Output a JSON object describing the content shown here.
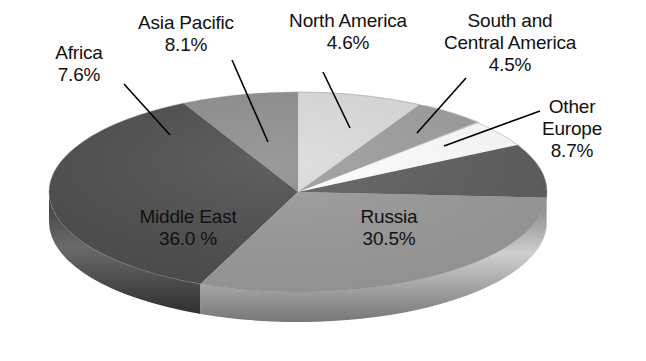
{
  "chart_data": {
    "type": "pie",
    "title": "",
    "subtitle": "",
    "xlabel": "",
    "ylabel": "",
    "legend_position": "none",
    "grid": false,
    "style": "3d-pie-grayscale",
    "value_unit": "%",
    "categories": [
      "Middle East",
      "Russia",
      "Other Europe",
      "Asia Pacific",
      "Africa",
      "North America",
      "South and Central America"
    ],
    "values": [
      36.0,
      30.5,
      8.7,
      8.1,
      7.6,
      4.6,
      4.5
    ],
    "slices": [
      {
        "name": "asia-pacific",
        "label_line1": "Asia Pacific",
        "label_line2": "8.1%",
        "value": 8.1,
        "color": "#dcdcdc",
        "side_color": "#bdbdbd",
        "label_placement": "outside-top-left",
        "has_leader_line": true
      },
      {
        "name": "north-america",
        "label_line1": "North America",
        "label_line2": "4.6%",
        "value": 4.6,
        "color": "#9e9e9e",
        "side_color": "#848484",
        "label_placement": "outside-top",
        "has_leader_line": true
      },
      {
        "name": "south-and-central-america",
        "label_line1": "South and",
        "label_line2": "Central America",
        "label_line3": "4.5%",
        "value": 4.5,
        "color": "#c9c9c9",
        "side_color": "#ababab",
        "label_placement": "outside-top-right",
        "has_leader_line": true
      },
      {
        "name": "other-europe",
        "label_line1": "Other",
        "label_line2": "Europe",
        "label_line3": "8.7%",
        "value": 8.7,
        "color": "#5e5e5e",
        "side_color": "#4a4a4a",
        "label_placement": "outside-right",
        "has_leader_line": true
      },
      {
        "name": "russia",
        "label_line1": "Russia",
        "label_line2": "30.5%",
        "value": 30.5,
        "color": "#9a9a9a",
        "side_color": "#8a8a8a",
        "label_placement": "inside",
        "has_leader_line": false
      },
      {
        "name": "middle-east",
        "label_line1": "Middle East",
        "label_line2": "36.0 %",
        "value": 36.0,
        "color": "#4e4e4e",
        "side_color": "#3d3d3d",
        "label_placement": "inside",
        "has_leader_line": false
      },
      {
        "name": "africa",
        "label_line1": "Africa",
        "label_line2": "7.6%",
        "value": 7.6,
        "color": "#8f8f8f",
        "side_color": "#777777",
        "label_placement": "outside-left",
        "has_leader_line": true
      }
    ],
    "total": 100.0
  },
  "labels": {
    "africa": {
      "line1": "Africa",
      "line2": "7.6%"
    },
    "asia_pacific": {
      "line1": "Asia Pacific",
      "line2": "8.1%"
    },
    "north_america": {
      "line1": "North America",
      "line2": "4.6%"
    },
    "south_central_america": {
      "line1": "South and",
      "line2": "Central America",
      "line3": "4.5%"
    },
    "other_europe": {
      "line1": "Other",
      "line2": "Europe",
      "line3": "8.7%"
    },
    "middle_east": {
      "line1": "Middle East",
      "line2": "36.0 %"
    },
    "russia": {
      "line1": "Russia",
      "line2": "30.5%"
    }
  },
  "colors": {
    "background": "#ffffff",
    "text": "#111111",
    "leader_line": "#000000"
  }
}
